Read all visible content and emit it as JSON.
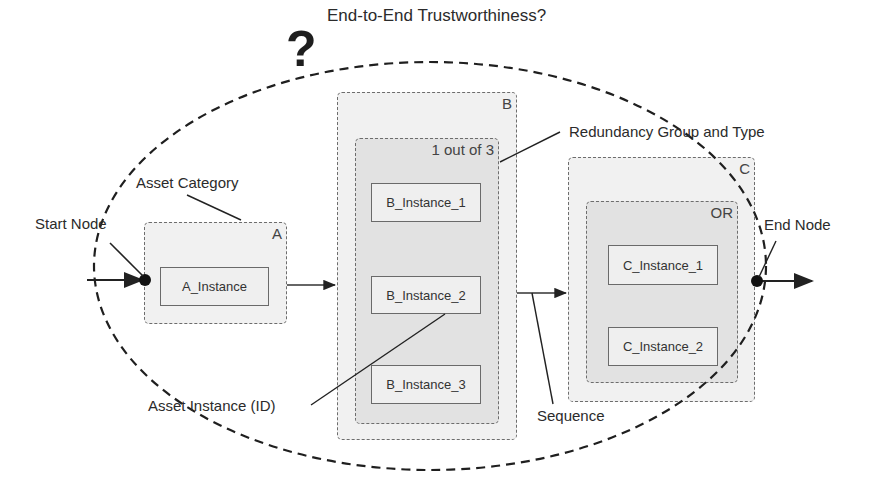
{
  "title": "End-to-End Trustworthiness?",
  "question_mark": "?",
  "annotations": {
    "start_node": "Start Node",
    "end_node": "End Node",
    "asset_category": "Asset Category",
    "redundancy_group": "Redundancy Group and Type",
    "asset_instance": "Asset Instance (ID)",
    "sequence": "Sequence"
  },
  "categories": {
    "A": {
      "label": "A",
      "instances": [
        "A_Instance"
      ]
    },
    "B": {
      "label": "B",
      "group_type": "1 out of 3",
      "instances": [
        "B_Instance_1",
        "B_Instance_2",
        "B_Instance_3"
      ]
    },
    "C": {
      "label": "C",
      "group_type": "OR",
      "instances": [
        "C_Instance_1",
        "C_Instance_2"
      ]
    }
  },
  "colors": {
    "outer_fill": "#f1f1f1",
    "inner_fill": "#e2e2e2",
    "instance_fill": "#efefef",
    "line": "#222222"
  }
}
